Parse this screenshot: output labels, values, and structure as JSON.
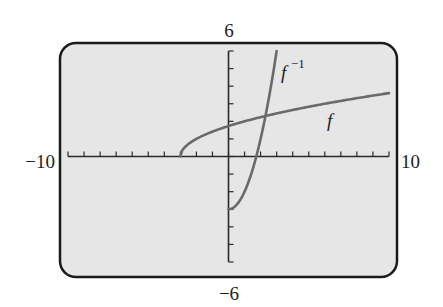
{
  "chart_data": {
    "type": "line",
    "title": "",
    "xlabel": "",
    "ylabel": "",
    "xlim": [
      -10,
      10
    ],
    "ylim": [
      -6,
      6
    ],
    "xscale_ticks": 1,
    "yscale_ticks": 1,
    "grid": false,
    "window_labels": {
      "xmin": "−10",
      "xmax": "10",
      "ymin": "−6",
      "ymax": "6"
    },
    "series": [
      {
        "name": "f",
        "label": "f",
        "expression": "sqrt(x+3)",
        "domain": [
          -3,
          10
        ],
        "points": [
          [
            -3,
            0
          ],
          [
            -2,
            1
          ],
          [
            0,
            1.73
          ],
          [
            1,
            2
          ],
          [
            2.3,
            2.3
          ],
          [
            6,
            3
          ],
          [
            10,
            3.61
          ]
        ]
      },
      {
        "name": "f_inverse",
        "label": "f",
        "label_superscript": "−1",
        "expression": "x^2-3, x>=0",
        "domain": [
          0,
          3
        ],
        "points": [
          [
            0,
            -3
          ],
          [
            1,
            -2
          ],
          [
            1.73,
            0
          ],
          [
            2,
            1
          ],
          [
            2.3,
            2.3
          ],
          [
            3,
            6
          ]
        ]
      }
    ]
  },
  "colors": {
    "screen": "#e6e6e6",
    "frame": "#1a1a1a",
    "curve": "#6a6a6a",
    "axis": "#2a2a2a"
  }
}
